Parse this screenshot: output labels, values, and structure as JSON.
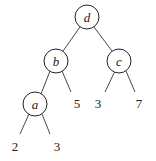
{
  "tree": {
    "nodes": [
      {
        "id": "d",
        "label": "d",
        "cx": 87,
        "cy": 17
      },
      {
        "id": "b",
        "label": "b",
        "cx": 56,
        "cy": 61
      },
      {
        "id": "c",
        "label": "c",
        "cx": 119,
        "cy": 61
      },
      {
        "id": "a",
        "label": "a",
        "cx": 35,
        "cy": 104
      }
    ],
    "leaves": [
      {
        "label": "5",
        "x": 77,
        "y": 108
      },
      {
        "label": "3",
        "x": 98,
        "y": 108
      },
      {
        "label": "7",
        "x": 139,
        "y": 108
      },
      {
        "label": "2",
        "x": 15,
        "y": 151
      },
      {
        "label": "3",
        "x": 57,
        "y": 151
      }
    ],
    "edges": [
      {
        "from": "d",
        "to": "b"
      },
      {
        "from": "d",
        "to": "c"
      },
      {
        "from": "b",
        "to": "a"
      },
      {
        "from": "b",
        "to": "5"
      },
      {
        "from": "c",
        "to": "3"
      },
      {
        "from": "c",
        "to": "7"
      },
      {
        "from": "a",
        "to": "2"
      },
      {
        "from": "a",
        "to": "3"
      }
    ]
  }
}
